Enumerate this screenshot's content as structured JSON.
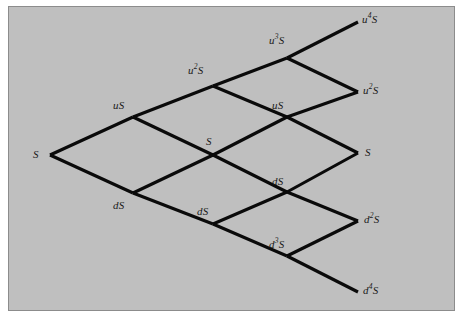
{
  "figure": {
    "kind": "binomial-lattice",
    "title": "",
    "background_color": "#bfbfbf",
    "border_color": "#8c8c8c",
    "page_color": "#ffffff",
    "edge_color": "#0a0a0a",
    "label_color": "#1a1a1a",
    "steps": 4
  },
  "nodes": [
    {
      "id": "n0-0",
      "base": "S",
      "exp": "",
      "x": 50,
      "y": 155,
      "label_x": 33,
      "label_y": 149,
      "align": "right"
    },
    {
      "id": "n1-u",
      "base": "u",
      "exp": "",
      "x": 133,
      "y": 117,
      "label_x": 113,
      "label_y": 100,
      "align": "left",
      "text": "uS"
    },
    {
      "id": "n1-d",
      "base": "d",
      "exp": "",
      "x": 133,
      "y": 193,
      "label_x": 113,
      "label_y": 200,
      "align": "left",
      "text": "dS"
    },
    {
      "id": "n2-uu",
      "base": "u",
      "exp": "2",
      "x": 213,
      "y": 86,
      "label_x": 188,
      "label_y": 65,
      "align": "left",
      "text": "u2S"
    },
    {
      "id": "n2-ud",
      "base": "S",
      "exp": "",
      "x": 213,
      "y": 155,
      "label_x": 206,
      "label_y": 136,
      "align": "left",
      "text": "S"
    },
    {
      "id": "n2-dd",
      "base": "d",
      "exp": "",
      "x": 213,
      "y": 224,
      "label_x": 197,
      "label_y": 206,
      "align": "left",
      "text": "dS"
    },
    {
      "id": "n3-uuu",
      "base": "u",
      "exp": "3",
      "x": 287,
      "y": 58,
      "label_x": 269,
      "label_y": 35,
      "align": "left",
      "text": "u3S"
    },
    {
      "id": "n3-uud",
      "base": "u",
      "exp": "",
      "x": 287,
      "y": 117,
      "label_x": 272,
      "label_y": 100,
      "align": "left",
      "text": "uS"
    },
    {
      "id": "n3-udd",
      "base": "d",
      "exp": "",
      "x": 287,
      "y": 192,
      "label_x": 272,
      "label_y": 176,
      "align": "left",
      "text": "dS"
    },
    {
      "id": "n3-ddd",
      "base": "d",
      "exp": "3",
      "x": 287,
      "y": 256,
      "label_x": 269,
      "label_y": 239,
      "align": "left",
      "text": "d3S"
    },
    {
      "id": "n4-u4",
      "base": "u",
      "exp": "4",
      "x": 358,
      "y": 22,
      "label_x": 362,
      "label_y": 14,
      "align": "left",
      "text": "u4S"
    },
    {
      "id": "n4-u2",
      "base": "u",
      "exp": "2",
      "x": 358,
      "y": 92,
      "label_x": 363,
      "label_y": 85,
      "align": "left",
      "text": "u2S"
    },
    {
      "id": "n4-s",
      "base": "S",
      "exp": "",
      "x": 358,
      "y": 153,
      "label_x": 365,
      "label_y": 147,
      "align": "left",
      "text": "S"
    },
    {
      "id": "n4-d2",
      "base": "d",
      "exp": "2",
      "x": 358,
      "y": 221,
      "label_x": 364,
      "label_y": 214,
      "align": "left",
      "text": "d2S"
    },
    {
      "id": "n4-d4",
      "base": "d",
      "exp": "4",
      "x": 358,
      "y": 292,
      "label_x": 363,
      "label_y": 285,
      "align": "left",
      "text": "d4S"
    }
  ],
  "labels": {
    "root_s": "S",
    "up_1": "uS",
    "down_1": "dS",
    "up_2_base": "u",
    "up_2_exp": "2",
    "mid_s_2": "S",
    "down_2": "dS",
    "up_3_base": "u",
    "up_3_exp": "3",
    "up_3_mid": "uS",
    "down_3_mid": "dS",
    "down_3_base": "d",
    "down_3_exp": "3",
    "term_u4_base": "u",
    "term_u4_exp": "4",
    "term_u2_base": "u",
    "term_u2_exp": "2",
    "term_s": "S",
    "term_d2_base": "d",
    "term_d2_exp": "2",
    "term_d4_base": "d",
    "term_d4_exp": "4",
    "suffix_s": "S"
  },
  "edges": [
    {
      "from": "n0-0",
      "to": "n1-u",
      "dir": "up"
    },
    {
      "from": "n0-0",
      "to": "n1-d",
      "dir": "down"
    },
    {
      "from": "n1-u",
      "to": "n2-uu",
      "dir": "up"
    },
    {
      "from": "n1-u",
      "to": "n2-ud",
      "dir": "down"
    },
    {
      "from": "n1-d",
      "to": "n2-ud",
      "dir": "up"
    },
    {
      "from": "n1-d",
      "to": "n2-dd",
      "dir": "down"
    },
    {
      "from": "n2-uu",
      "to": "n3-uuu",
      "dir": "up"
    },
    {
      "from": "n2-uu",
      "to": "n3-uud",
      "dir": "down"
    },
    {
      "from": "n2-ud",
      "to": "n3-uud",
      "dir": "up"
    },
    {
      "from": "n2-ud",
      "to": "n3-udd",
      "dir": "down"
    },
    {
      "from": "n2-dd",
      "to": "n3-udd",
      "dir": "up"
    },
    {
      "from": "n2-dd",
      "to": "n3-ddd",
      "dir": "down"
    },
    {
      "from": "n3-uuu",
      "to": "n4-u4",
      "dir": "up"
    },
    {
      "from": "n3-uuu",
      "to": "n4-u2",
      "dir": "down"
    },
    {
      "from": "n3-uud",
      "to": "n4-u2",
      "dir": "up"
    },
    {
      "from": "n3-uud",
      "to": "n4-s",
      "dir": "down"
    },
    {
      "from": "n3-udd",
      "to": "n4-s",
      "dir": "up"
    },
    {
      "from": "n3-udd",
      "to": "n4-d2",
      "dir": "down"
    },
    {
      "from": "n3-ddd",
      "to": "n4-d2",
      "dir": "up"
    },
    {
      "from": "n3-ddd",
      "to": "n4-d4",
      "dir": "down"
    }
  ]
}
